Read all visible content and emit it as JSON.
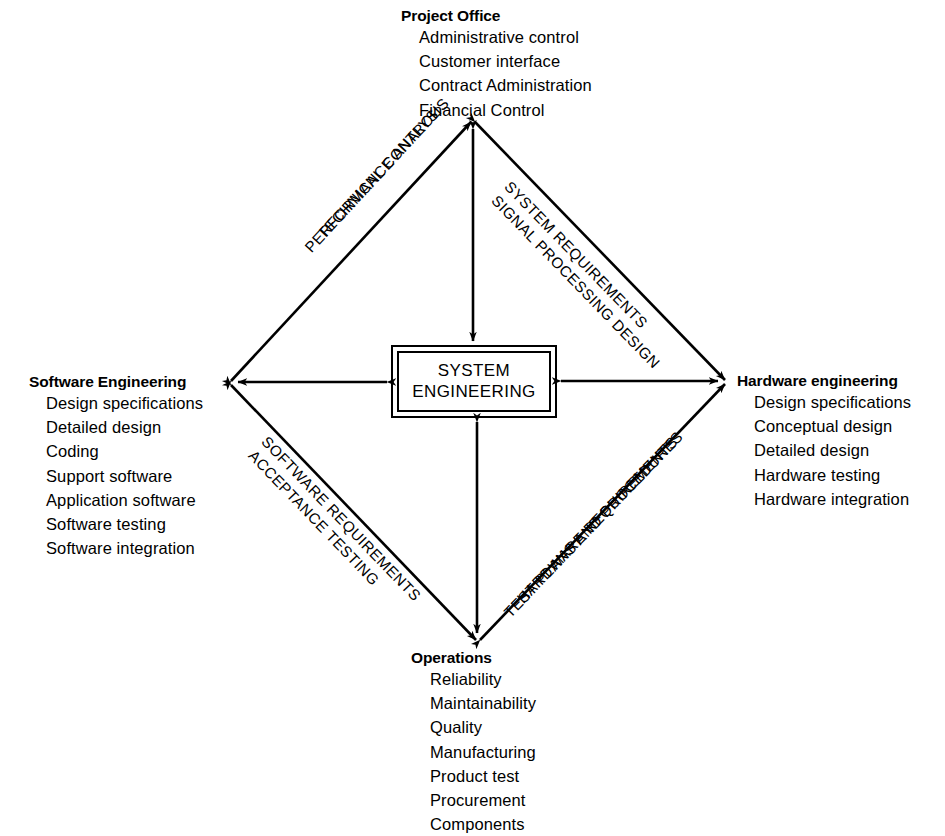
{
  "diagram": {
    "center": {
      "label": "SYSTEM\nENGINEERING"
    },
    "corners": [
      {
        "id": "project-office",
        "heading": "Project Office",
        "items": [
          "Administrative control",
          "Customer interface",
          "Contract Administration",
          "Financial Control"
        ]
      },
      {
        "id": "software-engineering",
        "heading": "Software Engineering",
        "items": [
          "Design specifications",
          "Detailed design",
          "Coding",
          "Support software",
          "Application software",
          "Software testing",
          "Software integration"
        ]
      },
      {
        "id": "hardware-engineering",
        "heading": "Hardware engineering",
        "items": [
          "Design specifications",
          "Conceptual design",
          "Detailed design",
          "Hardware testing",
          "Hardware integration"
        ]
      },
      {
        "id": "operations",
        "heading": "Operations",
        "items": [
          "Reliability",
          "Maintainability",
          "Quality",
          "Manufacturing",
          "Product test",
          "Procurement",
          "Components"
        ]
      }
    ],
    "edge_labels": {
      "upper_left": {
        "line1": "TECHNICAL CONTROL",
        "line2": "PERFORMANCE ANALYSIS"
      },
      "upper_right": {
        "line1": "SYSTEM REQUIREMENTS",
        "line2": "SIGNAL PROCESSING DESIGN"
      },
      "lower_left": {
        "line1": "SOFTWARE REQUIREMENTS",
        "line2": "ACCEPTANCE TESTING"
      },
      "lower_right": {
        "line1": "HARDWARE REQUIREMENTS",
        "line2": "TEST PLANS AND PROCEDURES"
      }
    },
    "colors": {
      "ink": "#000000",
      "background": "#ffffff"
    }
  }
}
